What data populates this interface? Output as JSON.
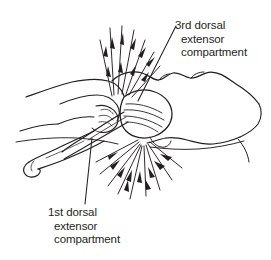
{
  "figure": {
    "type": "medical-line-illustration",
    "background_color": "#ffffff",
    "ink_color": "#231f20",
    "text_color": "#231f20"
  },
  "labels": {
    "upper": {
      "name": "3rd dorsal extensor compartment",
      "line1": "3rd dorsal",
      "line2": "extensor",
      "line3": "compartment"
    },
    "lower": {
      "name": "1st dorsal extensor compartment",
      "line1": "1st dorsal",
      "line2": "extensor",
      "line3": "compartment"
    }
  }
}
